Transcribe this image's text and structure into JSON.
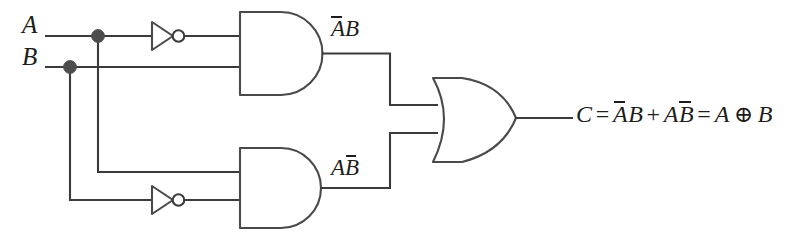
{
  "diagram": {
    "type": "logic-circuit-schematic",
    "background_color": "#ffffff",
    "line_color": "#3b3b3b",
    "text_color": "#1d1d1d"
  },
  "inputs": [
    {
      "id": "A",
      "label": "A",
      "y": 36
    },
    {
      "id": "B",
      "label": "B",
      "y": 67
    }
  ],
  "labels": {
    "input_a": "A",
    "input_b": "B",
    "and1_output": {
      "term1_bar": "A",
      "term2": "B"
    },
    "and2_output": {
      "term1": "A",
      "term2_bar": "B"
    }
  },
  "output_expression": {
    "result": "C",
    "equals": "=",
    "product1_bar": "A",
    "product1_plain": "B",
    "plus": "+",
    "product2_plain": "A",
    "product2_bar": "B",
    "equals2": "=",
    "xor_left": "A",
    "xor_symbol": "⊕",
    "xor_right": "B",
    "full_text": "C = AB + AB = A ⊕ B"
  },
  "gates": [
    {
      "id": "not1",
      "type": "NOT",
      "name": "inverter-a",
      "input": "A",
      "output": "A-bar"
    },
    {
      "id": "not2",
      "type": "NOT",
      "name": "inverter-b",
      "input": "B",
      "output": "B-bar"
    },
    {
      "id": "and1",
      "type": "AND",
      "name": "and-gate-top",
      "inputs": [
        "A-bar",
        "B"
      ],
      "output": "A-bar B"
    },
    {
      "id": "and2",
      "type": "AND",
      "name": "and-gate-bottom",
      "inputs": [
        "A",
        "B-bar"
      ],
      "output": "A B-bar"
    },
    {
      "id": "or1",
      "type": "OR",
      "name": "or-gate",
      "inputs": [
        "A-bar B",
        "A B-bar"
      ],
      "output": "C"
    }
  ],
  "junctions": [
    {
      "id": "dot-a",
      "on_line": "A",
      "x": 98,
      "y": 36
    },
    {
      "id": "dot-b",
      "on_line": "B",
      "x": 70,
      "y": 67
    }
  ]
}
